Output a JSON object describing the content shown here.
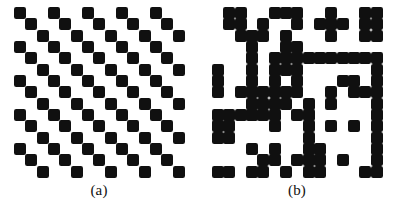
{
  "figure": {
    "background_color": "#ffffff",
    "foreground_color": "#101010",
    "width": 397,
    "height": 211
  },
  "panels": [
    {
      "id": "a",
      "caption": "(a)",
      "description": "regular diagonal staircase texture",
      "grid": {
        "rows": 15,
        "cols": 15,
        "cell_size": 11.33,
        "origin_x": 14,
        "origin_y": 7
      },
      "matrix": [
        [
          1,
          0,
          0,
          1,
          0,
          0,
          1,
          0,
          0,
          1,
          0,
          0,
          1,
          0,
          0
        ],
        [
          0,
          1,
          0,
          0,
          1,
          0,
          0,
          1,
          0,
          0,
          1,
          0,
          0,
          1,
          0
        ],
        [
          0,
          0,
          1,
          0,
          0,
          1,
          0,
          0,
          1,
          0,
          0,
          1,
          0,
          0,
          1
        ],
        [
          1,
          0,
          0,
          1,
          0,
          0,
          1,
          0,
          0,
          1,
          0,
          0,
          1,
          0,
          0
        ],
        [
          0,
          1,
          0,
          0,
          1,
          0,
          0,
          1,
          0,
          0,
          1,
          0,
          0,
          1,
          0
        ],
        [
          0,
          0,
          1,
          0,
          0,
          1,
          0,
          0,
          1,
          0,
          0,
          1,
          0,
          0,
          1
        ],
        [
          1,
          0,
          0,
          1,
          0,
          0,
          1,
          0,
          0,
          1,
          0,
          0,
          1,
          0,
          0
        ],
        [
          0,
          1,
          0,
          0,
          1,
          0,
          0,
          1,
          0,
          0,
          1,
          0,
          0,
          1,
          0
        ],
        [
          0,
          0,
          1,
          0,
          0,
          1,
          0,
          0,
          1,
          0,
          0,
          1,
          0,
          0,
          1
        ],
        [
          1,
          0,
          0,
          1,
          0,
          0,
          1,
          0,
          0,
          1,
          0,
          0,
          1,
          0,
          0
        ],
        [
          0,
          1,
          0,
          0,
          1,
          0,
          0,
          1,
          0,
          0,
          1,
          0,
          0,
          1,
          0
        ],
        [
          0,
          0,
          1,
          0,
          0,
          1,
          0,
          0,
          1,
          0,
          0,
          1,
          0,
          0,
          1
        ],
        [
          1,
          0,
          0,
          1,
          0,
          0,
          1,
          0,
          0,
          1,
          0,
          0,
          1,
          0,
          0
        ],
        [
          0,
          1,
          0,
          0,
          1,
          0,
          0,
          1,
          0,
          0,
          1,
          0,
          0,
          1,
          0
        ],
        [
          0,
          0,
          1,
          0,
          0,
          1,
          0,
          0,
          1,
          0,
          0,
          1,
          0,
          0,
          1
        ]
      ]
    },
    {
      "id": "b",
      "caption": "(b)",
      "description": "irregular random binary texture",
      "grid": {
        "rows": 15,
        "cols": 15,
        "cell_size": 11.33,
        "origin_x": 212,
        "origin_y": 7
      },
      "matrix": [
        [
          0,
          1,
          1,
          0,
          0,
          1,
          1,
          1,
          0,
          0,
          1,
          0,
          0,
          1,
          1
        ],
        [
          0,
          1,
          1,
          0,
          1,
          0,
          0,
          1,
          0,
          1,
          1,
          1,
          0,
          1,
          1
        ],
        [
          0,
          0,
          1,
          1,
          1,
          0,
          1,
          0,
          0,
          0,
          1,
          0,
          0,
          1,
          1
        ],
        [
          0,
          0,
          0,
          1,
          0,
          0,
          1,
          1,
          0,
          0,
          0,
          0,
          0,
          0,
          0
        ],
        [
          0,
          0,
          0,
          1,
          0,
          1,
          1,
          1,
          1,
          1,
          1,
          1,
          1,
          1,
          1
        ],
        [
          1,
          0,
          0,
          1,
          0,
          1,
          1,
          1,
          0,
          0,
          0,
          0,
          0,
          0,
          1
        ],
        [
          1,
          0,
          0,
          1,
          0,
          1,
          0,
          1,
          0,
          0,
          0,
          1,
          1,
          0,
          1
        ],
        [
          1,
          0,
          1,
          1,
          1,
          1,
          1,
          1,
          0,
          0,
          1,
          0,
          1,
          1,
          1
        ],
        [
          0,
          0,
          0,
          1,
          1,
          1,
          1,
          0,
          1,
          0,
          1,
          0,
          0,
          0,
          1
        ],
        [
          1,
          1,
          1,
          1,
          1,
          1,
          0,
          1,
          1,
          0,
          0,
          0,
          0,
          0,
          1
        ],
        [
          1,
          1,
          0,
          0,
          0,
          1,
          0,
          0,
          1,
          0,
          1,
          0,
          1,
          0,
          1
        ],
        [
          1,
          1,
          0,
          0,
          0,
          0,
          0,
          0,
          1,
          0,
          0,
          0,
          0,
          0,
          1
        ],
        [
          0,
          0,
          0,
          1,
          0,
          1,
          0,
          0,
          1,
          1,
          0,
          0,
          0,
          0,
          1
        ],
        [
          0,
          0,
          0,
          0,
          1,
          1,
          0,
          1,
          1,
          1,
          0,
          1,
          0,
          0,
          1
        ],
        [
          1,
          1,
          0,
          1,
          1,
          0,
          1,
          0,
          1,
          1,
          0,
          0,
          0,
          1,
          1
        ]
      ]
    }
  ]
}
